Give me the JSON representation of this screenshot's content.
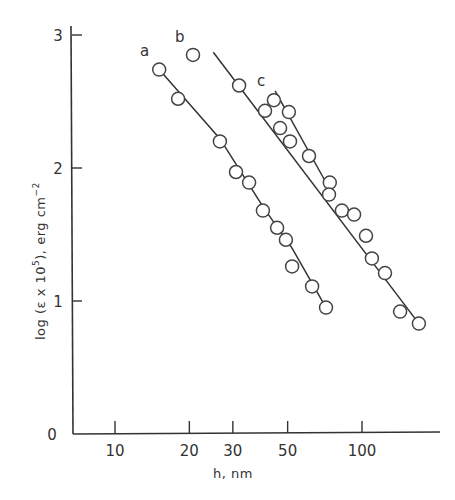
{
  "chart_data": {
    "type": "scatter",
    "title": "",
    "xlabel": "h,  nm",
    "ylabel": "log (ε x 10⁵), erg cm⁻²",
    "xscale": "log",
    "xlim": [
      6,
      200
    ],
    "ylim": [
      0,
      3.1
    ],
    "x_ticks": [
      10,
      20,
      30,
      50,
      100
    ],
    "x_tick_labels": [
      "10",
      "20",
      "30",
      "50",
      "100"
    ],
    "y_ticks": [
      0,
      1,
      2,
      3
    ],
    "y_tick_labels": [
      "0",
      "1",
      "2",
      "3"
    ],
    "grid": false,
    "legend": "none (curves labeled inline: a, b, c)",
    "series": [
      {
        "name": "a",
        "marker": "open-circle",
        "x": [
          15.1,
          18.0,
          26.6,
          30.9,
          34.9,
          39.7,
          45.3,
          49.2,
          52.1,
          62.8,
          71.5
        ],
        "y": [
          2.74,
          2.52,
          2.2,
          1.97,
          1.89,
          1.68,
          1.55,
          1.46,
          1.26,
          1.11,
          0.95
        ],
        "fit_line": {
          "x": [
            15.1,
            26.6,
            40,
            52,
            71.5
          ],
          "y": [
            2.74,
            2.22,
            1.7,
            1.4,
            0.95
          ]
        }
      },
      {
        "name": "b",
        "marker": "open-circle",
        "x": [
          20.7,
          31.8,
          40.5,
          46.6,
          51.1,
          61.0,
          74.1,
          82.9,
          103.8,
          109.7,
          123.9,
          170.0
        ],
        "y": [
          2.85,
          2.62,
          2.43,
          2.3,
          2.2,
          2.09,
          1.89,
          1.68,
          1.49,
          1.32,
          1.21,
          0.83
        ],
        "fit_line": {
          "x": [
            25.0,
            170.0
          ],
          "y": [
            2.87,
            0.83
          ]
        }
      },
      {
        "name": "c",
        "marker": "open-circle",
        "x": [
          44.0,
          50.6,
          73.5,
          92.9,
          142.6
        ],
        "y": [
          2.51,
          2.42,
          1.8,
          1.65,
          0.92
        ],
        "fit_line": {
          "x": [
            44.5,
            72.0
          ],
          "y": [
            2.58,
            1.88
          ]
        }
      }
    ]
  },
  "axes": {
    "x_title": "h,  nm",
    "y_title_prefix": "log  (ε x 10",
    "y_title_exp": "5",
    "y_title_suffix": "),  erg cm",
    "y_title_exp2": "−2",
    "x_tick_labels": [
      "10",
      "20",
      "30",
      "50",
      "100"
    ],
    "y_tick_labels": [
      "0",
      "1",
      "2",
      "3"
    ]
  },
  "labels": {
    "a": "a",
    "b": "b",
    "c": "c"
  }
}
